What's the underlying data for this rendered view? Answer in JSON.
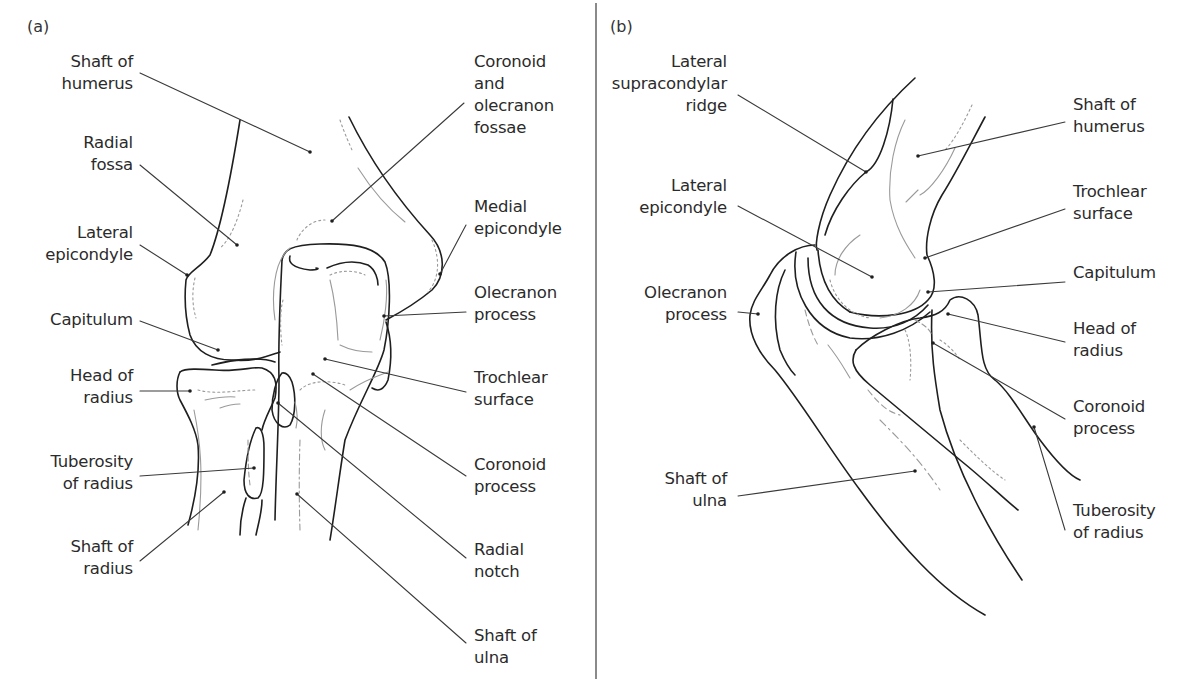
{
  "figure": {
    "panels": [
      {
        "id": "a",
        "tag": "(a)",
        "labels": [
          {
            "key": "shaft_of_humerus",
            "text": "Shaft of\nhumerus",
            "side": "left"
          },
          {
            "key": "radial_fossa",
            "text": "Radial\nfossa",
            "side": "left"
          },
          {
            "key": "lateral_epicondyle",
            "text": "Lateral\nepicondyle",
            "side": "left"
          },
          {
            "key": "capitulum",
            "text": "Capitulum",
            "side": "left"
          },
          {
            "key": "head_of_radius",
            "text": "Head of\nradius",
            "side": "left"
          },
          {
            "key": "tuberosity_of_radius",
            "text": "Tuberosity\nof radius",
            "side": "left"
          },
          {
            "key": "shaft_of_radius",
            "text": "Shaft of\nradius",
            "side": "left"
          },
          {
            "key": "coronoid_and_olecranon_fossae",
            "text": "Coronoid\nand\nolecranon\nfossae",
            "side": "right"
          },
          {
            "key": "medial_epicondyle",
            "text": "Medial\nepicondyle",
            "side": "right"
          },
          {
            "key": "olecranon_process",
            "text": "Olecranon\nprocess",
            "side": "right"
          },
          {
            "key": "trochlear_surface",
            "text": "Trochlear\nsurface",
            "side": "right"
          },
          {
            "key": "coronoid_process",
            "text": "Coronoid\nprocess",
            "side": "right"
          },
          {
            "key": "radial_notch",
            "text": "Radial\nnotch",
            "side": "right"
          },
          {
            "key": "shaft_of_ulna",
            "text": "Shaft of\nulna",
            "side": "right"
          }
        ]
      },
      {
        "id": "b",
        "tag": "(b)",
        "labels": [
          {
            "key": "lateral_supracondylar_ridge",
            "text": "Lateral\nsupracondylar\nridge",
            "side": "left"
          },
          {
            "key": "lateral_epicondyle",
            "text": "Lateral\nepicondyle",
            "side": "left"
          },
          {
            "key": "olecranon_process",
            "text": "Olecranon\nprocess",
            "side": "left"
          },
          {
            "key": "shaft_of_ulna",
            "text": "Shaft of\nulna",
            "side": "left"
          },
          {
            "key": "shaft_of_humerus",
            "text": "Shaft of\nhumerus",
            "side": "right"
          },
          {
            "key": "trochlear_surface",
            "text": "Trochlear\nsurface",
            "side": "right"
          },
          {
            "key": "capitulum",
            "text": "Capitulum",
            "side": "right"
          },
          {
            "key": "head_of_radius",
            "text": "Head of\nradius",
            "side": "right"
          },
          {
            "key": "coronoid_process",
            "text": "Coronoid\nprocess",
            "side": "right"
          },
          {
            "key": "tuberosity_of_radius",
            "text": "Tuberosity\nof radius",
            "side": "right"
          }
        ]
      }
    ],
    "colors": {
      "outline": "#1f1f1f",
      "leader": "#3a3a3a",
      "hidden": "#9a9a9a",
      "divider": "#8a8a8a",
      "background": "#ffffff"
    }
  }
}
